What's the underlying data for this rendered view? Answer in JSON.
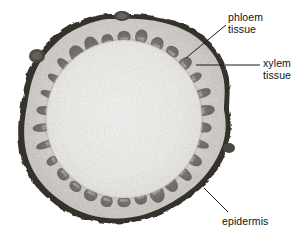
{
  "figure": {
    "background_color": "#ffffff",
    "image_style": "grayscale light micrograph"
  },
  "specimen": {
    "name": "stem-cross-section",
    "outline": "irregular rounded ellipse",
    "center_x": 124,
    "center_y": 119,
    "radius_x": 104,
    "radius_y": 105,
    "regions": [
      {
        "name": "epidermis",
        "description": "dark outer rim bounding the stem",
        "color": "#3a3a3a",
        "thickness_px": 4
      },
      {
        "name": "cortex",
        "description": "pale granular layer inside the epidermis",
        "color": "#cfcdc8"
      },
      {
        "name": "vascular-bundle-ring",
        "description": "ring of dark oval vascular bundles",
        "color": "#6e6a66",
        "bundle_count": 30,
        "ring_radius_ratio": 0.78
      },
      {
        "name": "pith",
        "description": "light speckled central ground tissue",
        "color": "#f0efec"
      }
    ],
    "protrusions": [
      {
        "name": "top-nodule",
        "x": 122,
        "y": 15
      },
      {
        "name": "upper-left-nodule",
        "x": 38,
        "y": 56
      },
      {
        "name": "right-nodule",
        "x": 229,
        "y": 148
      }
    ]
  },
  "labels": [
    {
      "id": "phloem",
      "name": "phloem-tissue-label",
      "line1": "phloem",
      "line2": "tissue",
      "text_x": 228,
      "text_y": 12,
      "leader": {
        "x1": 226,
        "y1": 25,
        "x2": 186,
        "y2": 58
      },
      "points_to": "vascular-bundle-ring"
    },
    {
      "id": "xylem",
      "name": "xylem-tissue-label",
      "line1": "xylem",
      "line2": "tissue",
      "text_x": 263,
      "text_y": 58,
      "leader": {
        "x1": 260,
        "y1": 65,
        "x2": 196,
        "y2": 65
      },
      "points_to": "vascular-bundle-ring"
    },
    {
      "id": "epidermis",
      "name": "epidermis-label",
      "line1": "epidermis",
      "line2": "",
      "text_x": 222,
      "text_y": 216,
      "leader": {
        "x1": 228,
        "y1": 212,
        "x2": 204,
        "y2": 188
      },
      "points_to": "epidermis"
    }
  ],
  "leader_line": {
    "color": "#1a1a1a",
    "width": 1
  }
}
